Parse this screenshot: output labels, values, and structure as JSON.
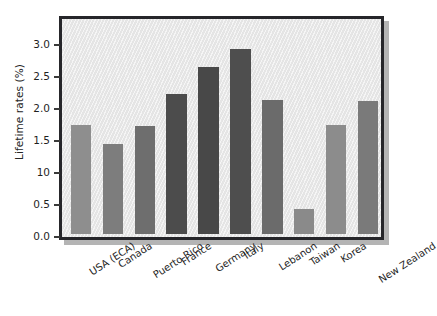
{
  "chart_data": {
    "type": "bar",
    "title": "",
    "subtitle": "",
    "xlabel": "",
    "ylabel": "Lifetime rates (%)",
    "ylim": [
      0.0,
      3.4
    ],
    "ytick_values": [
      0.0,
      0.5,
      1.0,
      1.5,
      2.0,
      2.5,
      3.0
    ],
    "ytick_labels": [
      "0.0",
      "0.5",
      "10",
      "1.5",
      "2.0",
      "2.5",
      "3.0"
    ],
    "grid": false,
    "legend": null,
    "legend_position": "none",
    "categories": [
      "USA (ECA)",
      "Canada",
      "Puerto Rico",
      "France",
      "Germany",
      "Italy",
      "Lebanon",
      "Taiwan",
      "Korea",
      "New Zealand"
    ],
    "values": [
      1.7,
      1.4,
      1.68,
      2.19,
      2.6,
      2.89,
      2.09,
      0.39,
      1.7,
      2.08
    ],
    "bar_colors": [
      "#8e8e8e",
      "#7d7d7d",
      "#6e6e6e",
      "#4c4c4c",
      "#484848",
      "#4e4e4e",
      "#6b6b6b",
      "#8a8a8a",
      "#8c8c8c",
      "#7a7a7a"
    ]
  },
  "style": {
    "frame_color": "#26262a",
    "plot_background": "#ebebeb",
    "shadow_color": "#b4b4b4",
    "text_color": "#1f1f1f",
    "page_background": "#ffffff"
  }
}
